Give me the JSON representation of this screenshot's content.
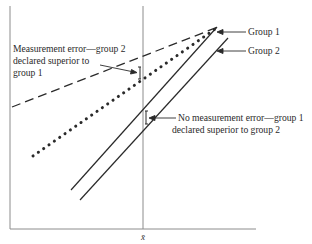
{
  "figure": {
    "background": "#ffffff",
    "axis_color": "#8c8c8c",
    "line_color": "#2a2a2a",
    "mean_label": "x̄"
  },
  "legend": {
    "group1": "Group 1",
    "group2": "Group 2"
  },
  "annotations": {
    "measurement_error": [
      "Measurement error—group 2",
      "declared superior to",
      "group 1"
    ],
    "no_measurement_error": [
      "No measurement error—group 1",
      "declared superior to group 2"
    ]
  },
  "lines": {
    "dashed": {
      "style": "dashed",
      "meaning": "group 2 with measurement error",
      "from": [
        12,
        107
      ],
      "to": [
        218,
        27
      ]
    },
    "dotted": {
      "style": "dotted",
      "meaning": "group 1 with measurement error",
      "from": [
        33,
        156
      ],
      "to": [
        218,
        27
      ]
    },
    "solid_group1": {
      "style": "solid",
      "meaning": "Group 1",
      "from": [
        71,
        190
      ],
      "to": [
        217,
        27
      ]
    },
    "solid_group2": {
      "style": "solid",
      "meaning": "Group 2",
      "from": [
        80,
        200
      ],
      "to": [
        228,
        38
      ]
    }
  }
}
